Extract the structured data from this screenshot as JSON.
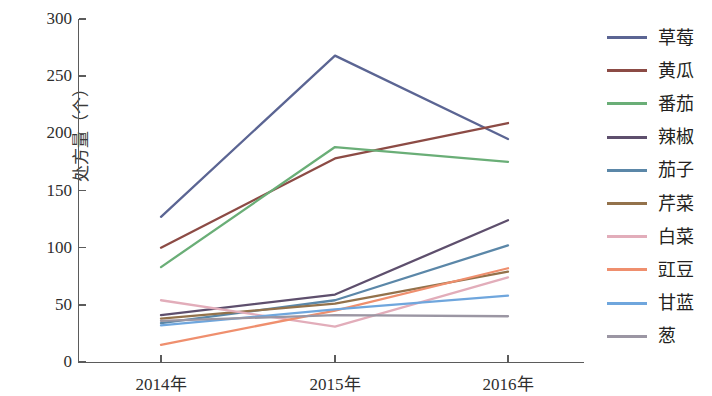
{
  "chart_data": {
    "type": "line",
    "title": "",
    "xlabel": "",
    "ylabel": "处方量（个）",
    "categories": [
      "2014年",
      "2015年",
      "2016年"
    ],
    "x_tick_labels": [
      "2014年",
      "2015年",
      "2016年"
    ],
    "y_tick_labels": [
      "0",
      "50",
      "100",
      "150",
      "200",
      "250",
      "300"
    ],
    "y_tick_values": [
      0,
      50,
      100,
      150,
      200,
      250,
      300
    ],
    "ylim": [
      0,
      300
    ],
    "grid": false,
    "legend_position": "right",
    "series": [
      {
        "name": "草莓",
        "color": "#5b6593",
        "values": [
          127,
          268,
          195
        ]
      },
      {
        "name": "黄瓜",
        "color": "#8c4b45",
        "values": [
          100,
          178,
          209
        ]
      },
      {
        "name": "番茄",
        "color": "#6aae77",
        "values": [
          83,
          188,
          175
        ]
      },
      {
        "name": "辣椒",
        "color": "#5e4f6d",
        "values": [
          41,
          59,
          124
        ]
      },
      {
        "name": "茄子",
        "color": "#5b87a8",
        "values": [
          34,
          54,
          102
        ]
      },
      {
        "name": "芹菜",
        "color": "#93724b",
        "values": [
          38,
          51,
          79
        ]
      },
      {
        "name": "白菜",
        "color": "#e2adba",
        "values": [
          54,
          31,
          74
        ]
      },
      {
        "name": "豇豆",
        "color": "#ef8f6e",
        "values": [
          15,
          45,
          82
        ]
      },
      {
        "name": "甘蓝",
        "color": "#6fa6dd",
        "values": [
          32,
          46,
          58
        ]
      },
      {
        "name": "葱",
        "color": "#9b96a3",
        "values": [
          36,
          41,
          40
        ]
      }
    ]
  },
  "legend": {
    "items": [
      {
        "label": "草莓"
      },
      {
        "label": "黄瓜"
      },
      {
        "label": "番茄"
      },
      {
        "label": "辣椒"
      },
      {
        "label": "茄子"
      },
      {
        "label": "芹菜"
      },
      {
        "label": "白菜"
      },
      {
        "label": "豇豆"
      },
      {
        "label": "甘蓝"
      },
      {
        "label": "葱"
      }
    ]
  }
}
